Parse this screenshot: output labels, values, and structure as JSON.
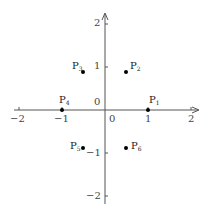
{
  "diagram": {
    "title": "",
    "origin_px": [
      105,
      110
    ],
    "unit_px": 43,
    "axes": {
      "x": {
        "range": [
          -2,
          2
        ],
        "ticks": [
          -2,
          -1,
          0,
          1,
          2
        ],
        "tick_labels": [
          "−2",
          "−1",
          "0",
          "1",
          "2"
        ]
      },
      "y": {
        "range": [
          -2,
          2
        ],
        "ticks": [
          -2,
          -1,
          0,
          1,
          2
        ],
        "tick_labels": [
          "−2",
          "−1",
          "0",
          "1",
          "2"
        ]
      }
    },
    "points": [
      {
        "id": "P1",
        "label": "P",
        "sub": "1",
        "x": 1,
        "y": 0
      },
      {
        "id": "P2",
        "label": "P",
        "sub": "2",
        "x": 0.5,
        "y": 0.866
      },
      {
        "id": "P3",
        "label": "P",
        "sub": "3",
        "x": -0.5,
        "y": 0.866
      },
      {
        "id": "P4",
        "label": "P",
        "sub": "4",
        "x": -1,
        "y": 0
      },
      {
        "id": "P5",
        "label": "P",
        "sub": "5",
        "x": -0.5,
        "y": -0.866
      },
      {
        "id": "P6",
        "label": "P",
        "sub": "6",
        "x": 0.5,
        "y": -0.866
      }
    ],
    "colors": {
      "axis": "#555555",
      "point": "#000000",
      "text": "#333333"
    }
  }
}
